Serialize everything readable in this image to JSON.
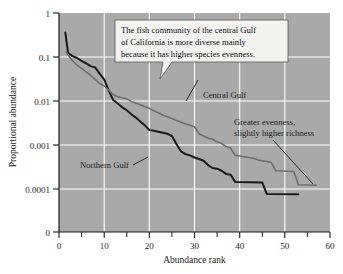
{
  "chart_data": {
    "type": "line",
    "title": "",
    "xlabel": "Abundance rank",
    "ylabel": "Proportional abundance",
    "xlim": [
      0,
      60
    ],
    "xticks": [
      0,
      10,
      20,
      30,
      40,
      50,
      60
    ],
    "xtick_labels": [
      "0",
      "10",
      "20",
      "30",
      "40",
      "50",
      "60"
    ],
    "xminor_ticks": [
      5,
      15,
      25,
      35,
      45,
      55
    ],
    "yscale": "log-with-zero-break",
    "yticks": [
      1,
      0.1,
      0.01,
      0.001,
      0.0001,
      0
    ],
    "ytick_labels": [
      "1",
      "0.1",
      "0.01",
      "0.001",
      "0.0001",
      "0"
    ],
    "grid": true,
    "legend_position": "inline-annotations",
    "plot_background": "#a9a9a9",
    "gridline_color": "#ffffff",
    "series": [
      {
        "name": "Northern Gulf",
        "color": "#1a1a1a",
        "width": 2.0,
        "points": [
          [
            1.4,
            0.36
          ],
          [
            2.0,
            0.125
          ],
          [
            3.0,
            0.105
          ],
          [
            4.0,
            0.095
          ],
          [
            5.0,
            0.082
          ],
          [
            6.0,
            0.072
          ],
          [
            7.0,
            0.062
          ],
          [
            8.0,
            0.058
          ],
          [
            9.0,
            0.042
          ],
          [
            10.0,
            0.031
          ],
          [
            11.0,
            0.0175
          ],
          [
            12.0,
            0.0105
          ],
          [
            13.0,
            0.0088
          ],
          [
            14.0,
            0.0072
          ],
          [
            15.0,
            0.0062
          ],
          [
            16.0,
            0.005
          ],
          [
            17.0,
            0.0042
          ],
          [
            18.0,
            0.0034
          ],
          [
            19.0,
            0.0028
          ],
          [
            20.0,
            0.0022
          ],
          [
            21.0,
            0.0021
          ],
          [
            22.0,
            0.002
          ],
          [
            23.0,
            0.0019
          ],
          [
            24.0,
            0.0018
          ],
          [
            25.0,
            0.0016
          ],
          [
            26.0,
            0.00105
          ],
          [
            27.0,
            0.00072
          ],
          [
            28.0,
            0.00062
          ],
          [
            29.0,
            0.00058
          ],
          [
            30.0,
            0.00052
          ],
          [
            31.0,
            0.00048
          ],
          [
            32.0,
            0.00044
          ],
          [
            33.0,
            0.00035
          ],
          [
            34.0,
            0.0003
          ],
          [
            35.0,
            0.00029
          ],
          [
            36.0,
            0.00026
          ],
          [
            37.0,
            0.00022
          ],
          [
            38.0,
            0.00021
          ],
          [
            39.0,
            0.000145
          ],
          [
            42.0,
            0.000142
          ],
          [
            45.0,
            0.00014
          ],
          [
            46.0,
            7.7e-05
          ],
          [
            53.0,
            7.6e-05
          ]
        ]
      },
      {
        "name": "Central Gulf",
        "color": "#6e6e6e",
        "width": 1.6,
        "points": [
          [
            1.6,
            0.128
          ],
          [
            2.0,
            0.112
          ],
          [
            3.0,
            0.082
          ],
          [
            4.0,
            0.065
          ],
          [
            5.0,
            0.055
          ],
          [
            6.0,
            0.046
          ],
          [
            7.0,
            0.038
          ],
          [
            8.0,
            0.031
          ],
          [
            9.0,
            0.025
          ],
          [
            10.0,
            0.022
          ],
          [
            11.0,
            0.0178
          ],
          [
            12.0,
            0.014
          ],
          [
            13.0,
            0.0125
          ],
          [
            14.0,
            0.0118
          ],
          [
            15.0,
            0.0112
          ],
          [
            16.0,
            0.0098
          ],
          [
            17.0,
            0.009
          ],
          [
            18.0,
            0.0082
          ],
          [
            19.0,
            0.0074
          ],
          [
            20.0,
            0.0068
          ],
          [
            21.0,
            0.006
          ],
          [
            22.0,
            0.0054
          ],
          [
            23.0,
            0.0048
          ],
          [
            24.0,
            0.0044
          ],
          [
            25.0,
            0.004
          ],
          [
            26.0,
            0.0036
          ],
          [
            27.0,
            0.0033
          ],
          [
            28.0,
            0.003
          ],
          [
            29.0,
            0.0028
          ],
          [
            30.0,
            0.0026
          ],
          [
            31.0,
            0.0018
          ],
          [
            32.0,
            0.0016
          ],
          [
            33.0,
            0.00145
          ],
          [
            34.0,
            0.00135
          ],
          [
            35.0,
            0.00118
          ],
          [
            36.0,
            0.00108
          ],
          [
            37.0,
            0.00092
          ],
          [
            38.0,
            0.00085
          ],
          [
            39.0,
            0.00058
          ],
          [
            40.0,
            0.00056
          ],
          [
            41.0,
            0.00054
          ],
          [
            42.0,
            0.00052
          ],
          [
            43.0,
            0.0005
          ],
          [
            44.0,
            0.00046
          ],
          [
            45.0,
            0.00044
          ],
          [
            46.0,
            0.00042
          ],
          [
            47.0,
            0.0004
          ],
          [
            48.0,
            0.00026
          ],
          [
            52.0,
            0.00025
          ],
          [
            53.0,
            0.000125
          ],
          [
            57.0,
            0.000122
          ]
        ]
      }
    ],
    "annotations": [
      {
        "id": "callout",
        "text_lines": [
          "The fish community of the central Gulf",
          "of California is more diverse mainly",
          "because it has higher species evenness."
        ]
      },
      {
        "id": "central-gulf-label",
        "text": "Central Gulf"
      },
      {
        "id": "northern-gulf-label",
        "text": "Northern Gulf"
      },
      {
        "id": "richness-note",
        "text_lines": [
          "Greater evenness,",
          "slightly higher richness"
        ]
      }
    ]
  }
}
